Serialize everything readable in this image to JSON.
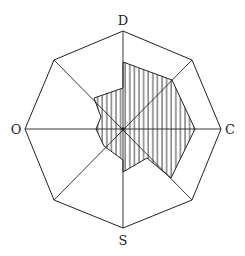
{
  "diagram": {
    "type": "octagonal radar diagram",
    "axis_labels": {
      "top": "D",
      "right": "C",
      "bottom": "S",
      "left": "O"
    },
    "colors": {
      "stroke": "#222222",
      "background": "#ffffff",
      "hatch": "#222222"
    },
    "fill_pattern": "vertical-hatch",
    "center": [
      123,
      129
    ],
    "outer_radius": 98,
    "outer_octagon": [
      [
        123,
        31
      ],
      [
        192,
        60
      ],
      [
        221,
        129
      ],
      [
        192,
        200
      ],
      [
        123,
        228
      ],
      [
        54,
        200
      ],
      [
        25,
        129
      ],
      [
        54,
        60
      ]
    ],
    "hatched_region": [
      [
        123,
        62
      ],
      [
        172,
        80
      ],
      [
        195,
        129
      ],
      [
        171,
        178
      ],
      [
        147,
        158
      ],
      [
        123,
        172
      ],
      [
        123,
        160
      ],
      [
        104,
        146
      ],
      [
        96,
        129
      ],
      [
        101,
        117
      ],
      [
        94,
        98
      ],
      [
        123,
        88
      ]
    ]
  }
}
